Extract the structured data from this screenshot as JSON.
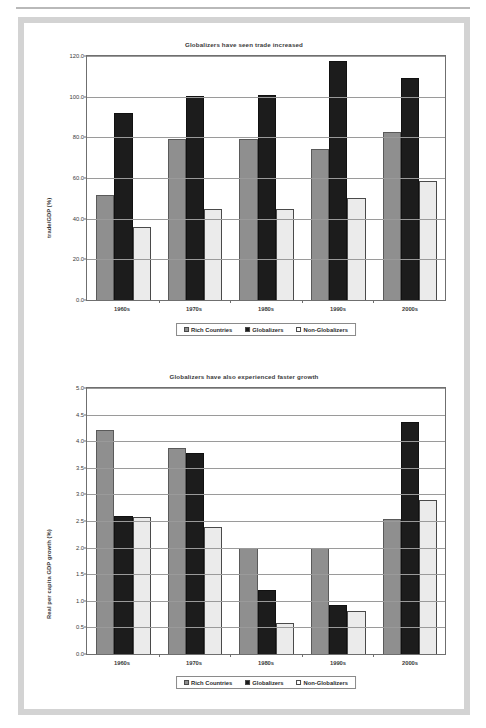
{
  "page": {
    "background": "#ffffff",
    "frame_color": "#d3d3d3"
  },
  "series_colors": {
    "rich_countries": "#8f8f8f",
    "globalizers": "#1c1c1c",
    "non_globalizers": "#ebebeb"
  },
  "legend": {
    "items": [
      {
        "label": "Rich Countries",
        "swatch": "legend-swatch-rich-countries"
      },
      {
        "label": "Globalizers",
        "swatch": "legend-swatch-globalizers"
      },
      {
        "label": "Non-Globalizers",
        "swatch": "legend-swatch-non-globalizers"
      }
    ]
  },
  "chart_data": [
    {
      "id": "trade-chart",
      "type": "bar",
      "title": "Globalizers have seen trade increased",
      "xlabel": "",
      "ylabel": "trade/GDP (%)",
      "categories": [
        "1960s",
        "1970s",
        "1980s",
        "1990s",
        "2000s"
      ],
      "ylim": [
        0.0,
        120.0
      ],
      "ytick_step": 20.0,
      "ytick_labels": [
        "0.0",
        "20.0",
        "40.0",
        "60.0",
        "80.0",
        "100.0",
        "120.0"
      ],
      "ytick_values": [
        0.0,
        20.0,
        40.0,
        60.0,
        80.0,
        100.0,
        120.0
      ],
      "grid": true,
      "legend_position": "bottom",
      "series": [
        {
          "name": "Rich Countries",
          "values": [
            51.5,
            79.0,
            79.0,
            74.5,
            82.5
          ]
        },
        {
          "name": "Globalizers",
          "values": [
            92.0,
            100.5,
            101.0,
            117.5,
            109.0
          ]
        },
        {
          "name": "Non-Globalizers",
          "values": [
            36.0,
            45.0,
            45.0,
            50.0,
            58.5
          ]
        }
      ]
    },
    {
      "id": "growth-chart",
      "type": "bar",
      "title": "Globalizers have also experienced faster growth",
      "xlabel": "",
      "ylabel": "Real per capita GDP growth (%)",
      "categories": [
        "1960s",
        "1970s",
        "1980s",
        "1990s",
        "2000s"
      ],
      "ylim": [
        0.0,
        5.0
      ],
      "ytick_step": 0.5,
      "ytick_labels": [
        "0.0",
        "0.5",
        "1.0",
        "1.5",
        "2.0",
        "2.5",
        "3.0",
        "3.5",
        "4.0",
        "4.5",
        "5.0"
      ],
      "ytick_values": [
        0.0,
        0.5,
        1.0,
        1.5,
        2.0,
        2.5,
        3.0,
        3.5,
        4.0,
        4.5,
        5.0
      ],
      "grid": true,
      "legend_position": "bottom",
      "series": [
        {
          "name": "Rich Countries",
          "values": [
            4.22,
            3.87,
            2.0,
            1.99,
            2.54
          ]
        },
        {
          "name": "Globalizers",
          "values": [
            2.6,
            3.78,
            1.21,
            0.92,
            4.37
          ]
        },
        {
          "name": "Non-Globalizers",
          "values": [
            2.57,
            2.38,
            0.58,
            0.8,
            2.9
          ]
        }
      ]
    }
  ]
}
